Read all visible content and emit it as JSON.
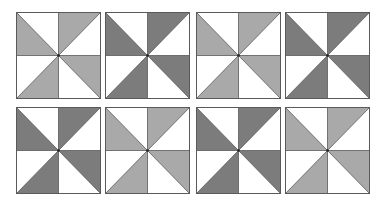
{
  "figure": {
    "background": "#ffffff",
    "tile_size": {
      "width": 85,
      "height": 87
    },
    "line_color": "#5a5a5a",
    "white": "#ffffff",
    "pattern": "pinwheel",
    "tiles": [
      {
        "id": 1,
        "row": 0,
        "col": 0,
        "x": 16,
        "y": 12,
        "shade": "light",
        "fill": "#a9a9a9"
      },
      {
        "id": 2,
        "row": 0,
        "col": 1,
        "x": 105,
        "y": 12,
        "shade": "dark",
        "fill": "#7c7c7c"
      },
      {
        "id": 3,
        "row": 0,
        "col": 2,
        "x": 196,
        "y": 12,
        "shade": "light",
        "fill": "#a9a9a9"
      },
      {
        "id": 4,
        "row": 0,
        "col": 3,
        "x": 285,
        "y": 12,
        "shade": "dark",
        "fill": "#7c7c7c"
      },
      {
        "id": 5,
        "row": 1,
        "col": 0,
        "x": 16,
        "y": 107,
        "shade": "dark",
        "fill": "#7c7c7c"
      },
      {
        "id": 6,
        "row": 1,
        "col": 1,
        "x": 105,
        "y": 107,
        "shade": "light",
        "fill": "#a9a9a9"
      },
      {
        "id": 7,
        "row": 1,
        "col": 2,
        "x": 196,
        "y": 107,
        "shade": "dark",
        "fill": "#7c7c7c"
      },
      {
        "id": 8,
        "row": 1,
        "col": 3,
        "x": 285,
        "y": 107,
        "shade": "light",
        "fill": "#a9a9a9"
      }
    ]
  }
}
